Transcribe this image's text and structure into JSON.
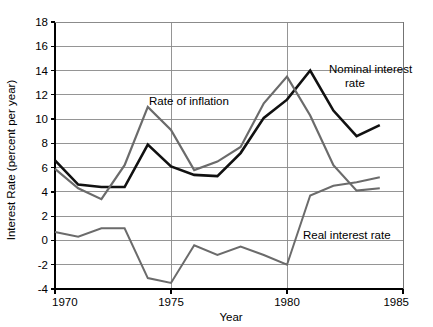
{
  "chart_data": {
    "type": "line",
    "title": "",
    "xlabel": "Year",
    "ylabel": "Interest Rate (percent per year)",
    "x": [
      1970,
      1971,
      1972,
      1973,
      1974,
      1975,
      1976,
      1977,
      1978,
      1979,
      1980,
      1981,
      1982,
      1983,
      1984
    ],
    "xlim": [
      1970,
      1985
    ],
    "ylim": [
      -4,
      18
    ],
    "xticks": [
      1970,
      1975,
      1980,
      1985
    ],
    "xtick_labels": [
      "1970",
      "1975",
      "1980",
      "1985"
    ],
    "yticks": [
      -4,
      -2,
      0,
      2,
      4,
      6,
      8,
      10,
      12,
      14,
      16,
      18
    ],
    "ytick_labels": [
      "-4",
      "-2",
      "0",
      "2",
      "4",
      "6",
      "8",
      "10",
      "12",
      "14",
      "16",
      "18"
    ],
    "grid": "horizontal-and-vertical",
    "legend": "inline-annotations",
    "series": [
      {
        "name": "Nominal interest rate",
        "color": "#111111",
        "width": 2.6,
        "values": [
          6.6,
          4.6,
          4.4,
          4.4,
          7.9,
          6.1,
          5.4,
          5.3,
          7.2,
          10.1,
          11.6,
          14.0,
          10.7,
          8.6,
          9.5
        ]
      },
      {
        "name": "Rate of inflation",
        "color": "#6b6b6b",
        "width": 2.2,
        "values": [
          5.9,
          4.3,
          3.4,
          6.2,
          11.0,
          9.1,
          5.8,
          6.5,
          7.7,
          11.3,
          13.5,
          10.3,
          6.2,
          4.1,
          4.3
        ]
      },
      {
        "name": "Real interest rate",
        "color": "#6b6b6b",
        "width": 2.0,
        "values": [
          0.7,
          0.3,
          1.0,
          1.0,
          -3.1,
          -3.5,
          -0.4,
          -1.2,
          -0.5,
          -1.2,
          -2.0,
          3.7,
          4.5,
          4.8,
          5.2
        ]
      }
    ],
    "annotations": [
      {
        "name": "rate-of-inflation-label",
        "text": "Rate of inflation",
        "x": 149,
        "y": 105
      },
      {
        "name": "nominal-interest-rate-label-line1",
        "text": "Nominal interest",
        "x": 329,
        "y": 73
      },
      {
        "name": "nominal-interest-rate-label-line2",
        "text": "rate",
        "x": 345,
        "y": 87
      },
      {
        "name": "real-interest-rate-label",
        "text": "Real interest rate",
        "x": 303,
        "y": 239
      }
    ],
    "colors": {
      "nominal": "#111111",
      "inflation": "#6b6b6b",
      "real": "#6b6b6b",
      "grid": "#8a8a8a",
      "axis": "#000000",
      "background": "#ffffff"
    }
  }
}
